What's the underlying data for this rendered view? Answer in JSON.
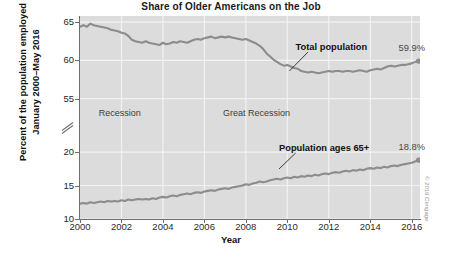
{
  "chart_data": {
    "type": "line",
    "title": "Share of Older Americans on the Job",
    "xlabel": "Year",
    "ylabel_line1": "Percent of the population employed",
    "ylabel_line2": "January 2000–May 2016",
    "xlim": [
      2000,
      2016.4
    ],
    "xticks": [
      "2000",
      "2002",
      "2004",
      "2006",
      "2008",
      "2010",
      "2012",
      "2014",
      "2016"
    ],
    "xtick_values": [
      2000,
      2002,
      2004,
      2006,
      2008,
      2010,
      2012,
      2014,
      2016
    ],
    "y_axis_broken": true,
    "y_upper_range": [
      53.5,
      65.8
    ],
    "y_upper_ticks": [
      "55",
      "60",
      "65"
    ],
    "y_upper_tick_values": [
      55,
      60,
      65
    ],
    "y_lower_range": [
      10,
      21.5
    ],
    "y_lower_ticks": [
      "10",
      "15",
      "20"
    ],
    "y_lower_tick_values": [
      10,
      15,
      20
    ],
    "grid": true,
    "legend_position": "inline-annotations",
    "annotations": [
      {
        "text": "Recession",
        "x": 2000.9,
        "y_px": 108
      },
      {
        "text": "Great Recession",
        "x": 2006.9,
        "y_px": 108
      },
      {
        "text": "Total population",
        "x": 2010.4,
        "y_px": 42,
        "bold": true
      },
      {
        "text": "Population ages 65+",
        "x": 2009.6,
        "y_px": 143,
        "bold": true
      }
    ],
    "endpoint_labels": [
      {
        "series": "Total population",
        "text": "59.9%",
        "value": 59.9,
        "x": 2016.33
      },
      {
        "series": "Population ages 65+",
        "text": "18.8%",
        "value": 18.8,
        "x": 2016.33
      }
    ],
    "series": [
      {
        "name": "Total population",
        "color": "#8c8c8c",
        "end_value": 59.9,
        "x": [
          2000.0,
          2000.17,
          2000.33,
          2000.5,
          2000.67,
          2000.83,
          2001.0,
          2001.17,
          2001.33,
          2001.5,
          2001.67,
          2001.83,
          2002.0,
          2002.17,
          2002.33,
          2002.5,
          2002.67,
          2002.83,
          2003.0,
          2003.17,
          2003.33,
          2003.5,
          2003.67,
          2003.83,
          2004.0,
          2004.17,
          2004.33,
          2004.5,
          2004.67,
          2004.83,
          2005.0,
          2005.17,
          2005.33,
          2005.5,
          2005.67,
          2005.83,
          2006.0,
          2006.17,
          2006.33,
          2006.5,
          2006.67,
          2006.83,
          2007.0,
          2007.17,
          2007.33,
          2007.5,
          2007.67,
          2007.83,
          2008.0,
          2008.17,
          2008.33,
          2008.5,
          2008.67,
          2008.83,
          2009.0,
          2009.17,
          2009.33,
          2009.5,
          2009.67,
          2009.83,
          2010.0,
          2010.17,
          2010.33,
          2010.5,
          2010.67,
          2010.83,
          2011.0,
          2011.17,
          2011.33,
          2011.5,
          2011.67,
          2011.83,
          2012.0,
          2012.17,
          2012.33,
          2012.5,
          2012.67,
          2012.83,
          2013.0,
          2013.17,
          2013.33,
          2013.5,
          2013.67,
          2013.83,
          2014.0,
          2014.17,
          2014.33,
          2014.5,
          2014.67,
          2014.83,
          2015.0,
          2015.17,
          2015.33,
          2015.5,
          2015.67,
          2015.83,
          2016.0,
          2016.17,
          2016.33
        ],
        "y": [
          64.4,
          64.6,
          64.4,
          64.8,
          64.6,
          64.5,
          64.4,
          64.3,
          64.2,
          64.0,
          63.9,
          63.8,
          63.6,
          63.5,
          63.2,
          62.7,
          62.5,
          62.4,
          62.3,
          62.5,
          62.3,
          62.2,
          62.1,
          62.0,
          62.3,
          62.1,
          62.2,
          62.4,
          62.3,
          62.5,
          62.4,
          62.3,
          62.5,
          62.7,
          62.8,
          62.7,
          62.9,
          63.0,
          63.1,
          62.9,
          63.0,
          63.1,
          63.0,
          63.1,
          63.0,
          62.9,
          62.8,
          62.7,
          62.8,
          62.6,
          62.4,
          62.2,
          61.9,
          61.5,
          60.9,
          60.5,
          60.1,
          59.8,
          59.5,
          59.3,
          59.4,
          59.2,
          59.0,
          58.9,
          58.6,
          58.5,
          58.4,
          58.5,
          58.4,
          58.3,
          58.4,
          58.5,
          58.6,
          58.5,
          58.6,
          58.6,
          58.5,
          58.6,
          58.6,
          58.5,
          58.6,
          58.7,
          58.6,
          58.5,
          58.7,
          58.8,
          58.9,
          58.8,
          59.0,
          59.2,
          59.3,
          59.2,
          59.3,
          59.4,
          59.4,
          59.5,
          59.6,
          59.8,
          59.9
        ]
      },
      {
        "name": "Population ages 65+",
        "color": "#8c8c8c",
        "end_value": 18.8,
        "x": [
          2000.0,
          2000.17,
          2000.33,
          2000.5,
          2000.67,
          2000.83,
          2001.0,
          2001.17,
          2001.33,
          2001.5,
          2001.67,
          2001.83,
          2002.0,
          2002.17,
          2002.33,
          2002.5,
          2002.67,
          2002.83,
          2003.0,
          2003.17,
          2003.33,
          2003.5,
          2003.67,
          2003.83,
          2004.0,
          2004.17,
          2004.33,
          2004.5,
          2004.67,
          2004.83,
          2005.0,
          2005.17,
          2005.33,
          2005.5,
          2005.67,
          2005.83,
          2006.0,
          2006.17,
          2006.33,
          2006.5,
          2006.67,
          2006.83,
          2007.0,
          2007.17,
          2007.33,
          2007.5,
          2007.67,
          2007.83,
          2008.0,
          2008.17,
          2008.33,
          2008.5,
          2008.67,
          2008.83,
          2009.0,
          2009.17,
          2009.33,
          2009.5,
          2009.67,
          2009.83,
          2010.0,
          2010.17,
          2010.33,
          2010.5,
          2010.67,
          2010.83,
          2011.0,
          2011.17,
          2011.33,
          2011.5,
          2011.67,
          2011.83,
          2012.0,
          2012.17,
          2012.33,
          2012.5,
          2012.67,
          2012.83,
          2013.0,
          2013.17,
          2013.33,
          2013.5,
          2013.67,
          2013.83,
          2014.0,
          2014.17,
          2014.33,
          2014.5,
          2014.67,
          2014.83,
          2015.0,
          2015.17,
          2015.33,
          2015.5,
          2015.67,
          2015.83,
          2016.0,
          2016.17,
          2016.33
        ],
        "y": [
          12.3,
          12.4,
          12.3,
          12.5,
          12.4,
          12.5,
          12.6,
          12.5,
          12.7,
          12.6,
          12.7,
          12.6,
          12.8,
          12.7,
          12.9,
          12.8,
          12.9,
          13.0,
          12.9,
          13.0,
          12.9,
          13.1,
          13.0,
          13.2,
          13.3,
          13.2,
          13.4,
          13.5,
          13.4,
          13.6,
          13.7,
          13.8,
          13.7,
          13.9,
          14.0,
          13.9,
          14.1,
          14.2,
          14.3,
          14.2,
          14.4,
          14.5,
          14.6,
          14.5,
          14.7,
          14.8,
          14.9,
          15.0,
          15.2,
          15.1,
          15.3,
          15.4,
          15.6,
          15.5,
          15.6,
          15.8,
          15.9,
          16.0,
          15.9,
          16.1,
          16.2,
          16.1,
          16.3,
          16.2,
          16.4,
          16.3,
          16.5,
          16.4,
          16.6,
          16.5,
          16.7,
          16.8,
          16.7,
          16.9,
          17.0,
          16.9,
          17.1,
          17.2,
          17.1,
          17.3,
          17.2,
          17.4,
          17.3,
          17.5,
          17.6,
          17.5,
          17.7,
          17.6,
          17.8,
          17.7,
          17.9,
          18.0,
          17.9,
          18.1,
          18.2,
          18.3,
          18.4,
          18.6,
          18.8
        ]
      }
    ]
  },
  "credit": "© 2019 Cengage",
  "colors": {
    "panel_background": "#dcdcdc",
    "gridline": "#f2f2f2",
    "series_gray": "#8c8c8c",
    "axis": "#6e6e6e",
    "text": "#1b1b1b"
  }
}
